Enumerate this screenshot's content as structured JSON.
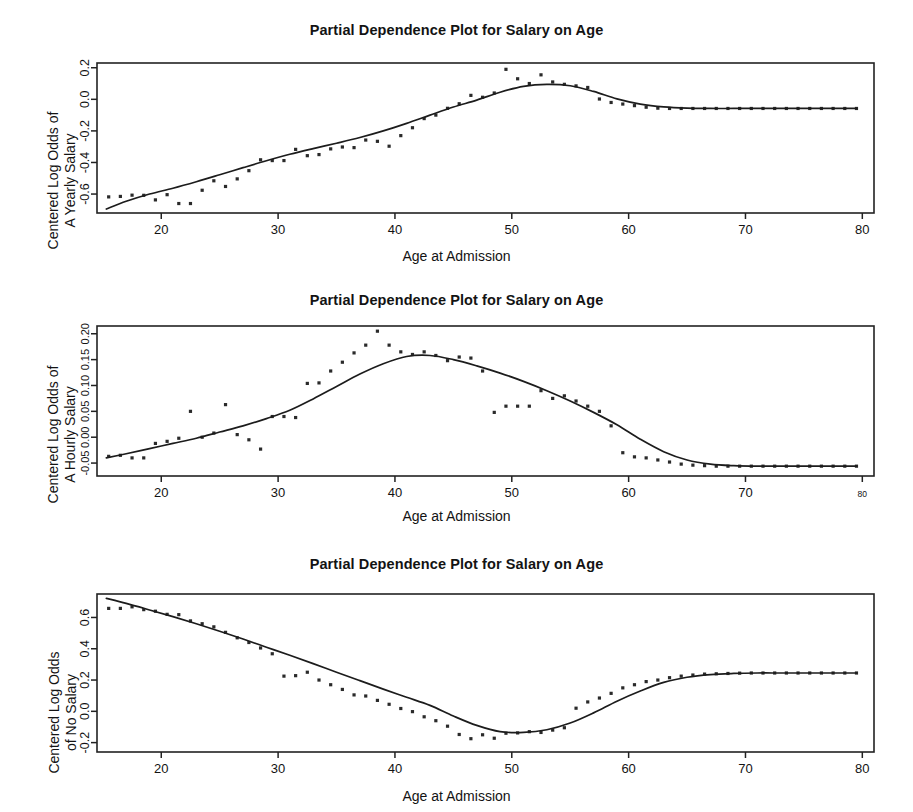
{
  "figure": {
    "background": "#ffffff",
    "ink_color": "#1c1c1c",
    "width": 913,
    "height": 812
  },
  "chart_data": [
    {
      "type": "scatter",
      "id": "panel-yearly-salary",
      "title": "Partial Dependence Plot for Salary on Age",
      "xlabel": "Age at Admission",
      "ylabel_line1": "Centered Log Odds of",
      "ylabel_line2": "A Yearly Salary",
      "ylabel": "Centered Log Odds of A Yearly Salary",
      "xlim": [
        14.5,
        81.0
      ],
      "ylim": [
        -0.72,
        0.23
      ],
      "xticks": [
        20,
        30,
        40,
        50,
        60,
        70,
        80
      ],
      "xticklabels": [
        "20",
        "30",
        "40",
        "50",
        "60",
        "70",
        "80"
      ],
      "yticks": [
        -0.6,
        -0.4,
        -0.2,
        0.0,
        0.2
      ],
      "yticklabels": [
        "-0.6",
        "-0.4",
        "-0.2",
        "0.0",
        "0.2"
      ],
      "grid": false,
      "legend": null,
      "series": [
        {
          "name": "observed partial dependence",
          "marker": "point",
          "x": [
            15.5,
            16.5,
            17.5,
            18.5,
            19.5,
            20.5,
            21.5,
            22.5,
            23.5,
            24.5,
            25.5,
            26.5,
            27.5,
            28.5,
            29.5,
            30.5,
            31.5,
            32.5,
            33.5,
            34.5,
            35.5,
            36.5,
            37.5,
            38.5,
            39.5,
            40.5,
            41.5,
            42.5,
            43.5,
            44.5,
            45.5,
            46.5,
            47.5,
            48.5,
            49.5,
            50.5,
            51.5,
            52.5,
            53.5,
            54.5,
            55.5,
            56.5,
            57.5,
            58.5,
            59.5,
            60.5,
            61.5,
            62.5,
            63.5,
            64.5,
            65.5,
            66.5,
            67.5,
            68.5,
            69.5,
            70.5,
            71.5,
            72.5,
            73.5,
            74.5,
            75.5,
            76.5,
            77.5,
            78.5,
            79.5
          ],
          "y": [
            -0.618,
            -0.615,
            -0.607,
            -0.608,
            -0.637,
            -0.604,
            -0.66,
            -0.66,
            -0.576,
            -0.516,
            -0.552,
            -0.504,
            -0.452,
            -0.383,
            -0.388,
            -0.388,
            -0.317,
            -0.357,
            -0.35,
            -0.314,
            -0.302,
            -0.306,
            -0.258,
            -0.266,
            -0.297,
            -0.23,
            -0.18,
            -0.122,
            -0.1,
            -0.057,
            -0.028,
            0.025,
            0.013,
            0.04,
            0.19,
            0.13,
            0.1,
            0.155,
            0.11,
            0.095,
            0.085,
            0.075,
            0.002,
            -0.02,
            -0.03,
            -0.04,
            -0.05,
            -0.056,
            -0.058,
            -0.058,
            -0.058,
            -0.058,
            -0.058,
            -0.058,
            -0.058,
            -0.058,
            -0.058,
            -0.058,
            -0.058,
            -0.058,
            -0.058,
            -0.058,
            -0.058,
            -0.058,
            -0.058
          ]
        },
        {
          "name": "smoothed fit",
          "marker": "line",
          "x": [
            15.3,
            17,
            19,
            21,
            23,
            25,
            27,
            29,
            31,
            33,
            35,
            37,
            39,
            41,
            43,
            45,
            47,
            49,
            51,
            53,
            55,
            57,
            59,
            61,
            63,
            65,
            67,
            69,
            71,
            73,
            75,
            77,
            79.5
          ],
          "y": [
            -0.695,
            -0.646,
            -0.6,
            -0.563,
            -0.522,
            -0.478,
            -0.433,
            -0.389,
            -0.348,
            -0.312,
            -0.278,
            -0.242,
            -0.2,
            -0.152,
            -0.1,
            -0.049,
            -0.005,
            0.045,
            0.082,
            0.095,
            0.086,
            0.05,
            0.003,
            -0.03,
            -0.048,
            -0.056,
            -0.058,
            -0.058,
            -0.058,
            -0.058,
            -0.058,
            -0.058,
            -0.058
          ]
        }
      ]
    },
    {
      "type": "scatter",
      "id": "panel-hourly-salary",
      "title": "Partial Dependence Plot for Salary on Age",
      "xlabel": "Age at Admission",
      "ylabel_line1": "Centered Log Odds of",
      "ylabel_line2": "A Hourly Salary",
      "ylabel": "Centered Log Odds of A Hourly Salary",
      "xlim": [
        14.5,
        81.0
      ],
      "ylim": [
        -0.075,
        0.215
      ],
      "xticks": [
        20,
        30,
        40,
        50,
        60,
        70,
        80
      ],
      "xticklabels": [
        "20",
        "30",
        "40",
        "50",
        "60",
        "70",
        "80"
      ],
      "yticks": [
        -0.05,
        0.0,
        0.05,
        0.1,
        0.15,
        0.2
      ],
      "yticklabels": [
        "-0.05",
        "0.00",
        "0.05",
        "0.10",
        "0.15",
        "0.20"
      ],
      "grid": false,
      "legend": null,
      "series": [
        {
          "name": "observed partial dependence",
          "marker": "point",
          "x": [
            15.5,
            16.5,
            17.5,
            18.5,
            19.5,
            20.5,
            21.5,
            22.5,
            23.5,
            24.5,
            25.5,
            26.5,
            27.5,
            28.5,
            29.5,
            30.5,
            31.5,
            32.5,
            33.5,
            34.5,
            35.5,
            36.5,
            37.5,
            38.5,
            39.5,
            40.5,
            41.5,
            42.5,
            43.5,
            44.5,
            45.5,
            46.5,
            47.5,
            48.5,
            49.5,
            50.5,
            51.5,
            52.5,
            53.5,
            54.5,
            55.5,
            56.5,
            57.5,
            58.5,
            59.5,
            60.5,
            61.5,
            62.5,
            63.5,
            64.5,
            65.5,
            66.5,
            67.5,
            68.5,
            69.5,
            70.5,
            71.5,
            72.5,
            73.5,
            74.5,
            75.5,
            76.5,
            77.5,
            78.5,
            79.5
          ],
          "y": [
            -0.037,
            -0.035,
            -0.04,
            -0.04,
            -0.012,
            -0.008,
            -0.002,
            0.05,
            0.0,
            0.008,
            0.063,
            0.005,
            -0.005,
            -0.023,
            0.04,
            0.04,
            0.038,
            0.104,
            0.105,
            0.128,
            0.145,
            0.163,
            0.178,
            0.205,
            0.178,
            0.165,
            0.16,
            0.165,
            0.158,
            0.148,
            0.155,
            0.153,
            0.128,
            0.048,
            0.06,
            0.06,
            0.06,
            0.09,
            0.075,
            0.08,
            0.07,
            0.06,
            0.05,
            0.022,
            -0.03,
            -0.038,
            -0.04,
            -0.044,
            -0.048,
            -0.052,
            -0.054,
            -0.055,
            -0.056,
            -0.056,
            -0.056,
            -0.056,
            -0.056,
            -0.056,
            -0.056,
            -0.056,
            -0.056,
            -0.056,
            -0.056,
            -0.056,
            -0.056
          ]
        },
        {
          "name": "smoothed fit",
          "marker": "line",
          "x": [
            15.3,
            17,
            19,
            21,
            23,
            25,
            27,
            29,
            31,
            33,
            35,
            37,
            39,
            41,
            43,
            45,
            47,
            49,
            51,
            53,
            55,
            57,
            59,
            61,
            63,
            65,
            67,
            69,
            71,
            73,
            75,
            77,
            79.5
          ],
          "y": [
            -0.04,
            -0.032,
            -0.022,
            -0.012,
            -0.002,
            0.01,
            0.022,
            0.036,
            0.052,
            0.074,
            0.098,
            0.122,
            0.142,
            0.156,
            0.158,
            0.15,
            0.138,
            0.124,
            0.108,
            0.09,
            0.07,
            0.048,
            0.024,
            -0.004,
            -0.028,
            -0.044,
            -0.052,
            -0.055,
            -0.056,
            -0.056,
            -0.056,
            -0.056,
            -0.056
          ]
        }
      ]
    },
    {
      "type": "scatter",
      "id": "panel-no-salary",
      "title": "Partial Dependence Plot for Salary on Age",
      "xlabel": "Age at Admission",
      "ylabel_line1": "Centered Log Odds",
      "ylabel_line2": "of No Salary",
      "ylabel": "Centered Log Odds of No Salary",
      "xlim": [
        14.5,
        81.0
      ],
      "ylim": [
        -0.26,
        0.75
      ],
      "xticks": [
        20,
        30,
        40,
        50,
        60,
        70,
        80
      ],
      "xticklabels": [
        "20",
        "30",
        "40",
        "50",
        "60",
        "70",
        "80"
      ],
      "yticks": [
        -0.2,
        0.0,
        0.2,
        0.4,
        0.6
      ],
      "yticklabels": [
        "-0.2",
        "0.0",
        "0.2",
        "0.4",
        "0.6"
      ],
      "grid": false,
      "legend": null,
      "series": [
        {
          "name": "observed partial dependence",
          "marker": "point",
          "x": [
            15.5,
            16.5,
            17.5,
            18.5,
            19.5,
            20.5,
            21.5,
            22.5,
            23.5,
            24.5,
            25.5,
            26.5,
            27.5,
            28.5,
            29.5,
            30.5,
            31.5,
            32.5,
            33.5,
            34.5,
            35.5,
            36.5,
            37.5,
            38.5,
            39.5,
            40.5,
            41.5,
            42.5,
            43.5,
            44.5,
            45.5,
            46.5,
            47.5,
            48.5,
            49.5,
            50.5,
            51.5,
            52.5,
            53.5,
            54.5,
            55.5,
            56.5,
            57.5,
            58.5,
            59.5,
            60.5,
            61.5,
            62.5,
            63.5,
            64.5,
            65.5,
            66.5,
            67.5,
            68.5,
            69.5,
            70.5,
            71.5,
            72.5,
            73.5,
            74.5,
            75.5,
            76.5,
            77.5,
            78.5,
            79.5
          ],
          "y": [
            0.658,
            0.658,
            0.668,
            0.65,
            0.64,
            0.62,
            0.618,
            0.578,
            0.56,
            0.54,
            0.505,
            0.47,
            0.44,
            0.405,
            0.368,
            0.225,
            0.228,
            0.25,
            0.2,
            0.17,
            0.14,
            0.105,
            0.098,
            0.07,
            0.045,
            0.018,
            -0.002,
            -0.035,
            -0.06,
            -0.095,
            -0.148,
            -0.175,
            -0.15,
            -0.172,
            -0.14,
            -0.138,
            -0.13,
            -0.135,
            -0.12,
            -0.105,
            0.02,
            0.06,
            0.085,
            0.115,
            0.15,
            0.17,
            0.19,
            0.2,
            0.215,
            0.225,
            0.232,
            0.238,
            0.24,
            0.242,
            0.244,
            0.245,
            0.245,
            0.245,
            0.245,
            0.245,
            0.245,
            0.245,
            0.245,
            0.245,
            0.245
          ]
        },
        {
          "name": "smoothed fit",
          "marker": "line",
          "x": [
            15.3,
            17,
            19,
            21,
            23,
            25,
            27,
            29,
            31,
            33,
            35,
            37,
            39,
            41,
            43,
            45,
            47,
            49,
            51,
            53,
            55,
            57,
            59,
            61,
            63,
            65,
            67,
            69,
            71,
            73,
            75,
            77,
            79.5
          ],
          "y": [
            0.722,
            0.69,
            0.648,
            0.605,
            0.56,
            0.512,
            0.462,
            0.41,
            0.358,
            0.305,
            0.25,
            0.196,
            0.142,
            0.09,
            0.038,
            -0.03,
            -0.09,
            -0.13,
            -0.135,
            -0.118,
            -0.075,
            -0.01,
            0.065,
            0.13,
            0.185,
            0.218,
            0.235,
            0.242,
            0.245,
            0.245,
            0.245,
            0.245,
            0.245
          ]
        }
      ]
    }
  ]
}
